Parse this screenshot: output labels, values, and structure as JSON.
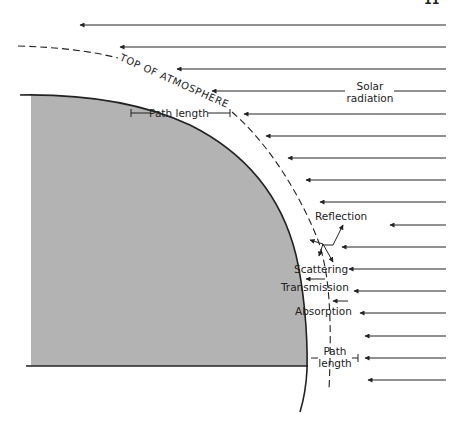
{
  "figure": {
    "page_number_fragment": "11",
    "colors": {
      "earth_fill": "#b3b3b3",
      "line": "#222222",
      "background": "#ffffff"
    },
    "labels": {
      "top_of_atmosphere": "TOP OF ATMOSPHERE",
      "solar_radiation_line1": "Solar",
      "solar_radiation_line2": "radiation",
      "path_length_top": "Path length",
      "reflection": "Reflection",
      "scattering": "Scattering",
      "transmission": "Transmission",
      "absorption": "Absorption",
      "path_length_bottom_line1": "Path",
      "path_length_bottom_line2": "length"
    },
    "incoming_rays": [
      {
        "y": 25,
        "x_tip": 78
      },
      {
        "y": 47,
        "x_tip": 118
      },
      {
        "y": 69,
        "x_tip": 175
      },
      {
        "y": 91,
        "x_tip": 210
      },
      {
        "y": 114,
        "x_tip": 242
      },
      {
        "y": 136,
        "x_tip": 264
      },
      {
        "y": 158,
        "x_tip": 286
      },
      {
        "y": 180,
        "x_tip": 304
      },
      {
        "y": 202,
        "x_tip": 318
      },
      {
        "y": 225,
        "x_tip": 318
      },
      {
        "y": 247,
        "x_tip": 340
      },
      {
        "y": 269,
        "x_tip": 347
      },
      {
        "y": 291,
        "x_tip": 352
      },
      {
        "y": 313,
        "x_tip": 358
      },
      {
        "y": 336,
        "x_tip": 363
      },
      {
        "y": 358,
        "x_tip": 363
      },
      {
        "y": 380,
        "x_tip": 366
      }
    ]
  }
}
